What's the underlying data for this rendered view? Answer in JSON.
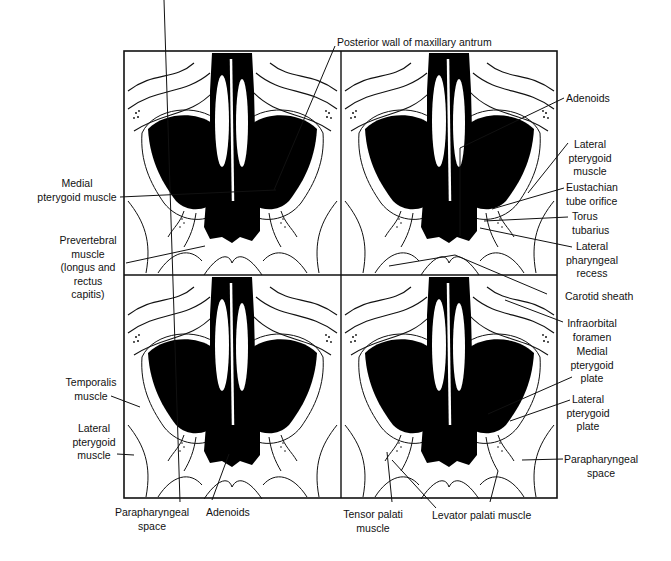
{
  "figure": {
    "type": "anatomical line drawing",
    "panels": [
      {
        "position": "top-left"
      },
      {
        "position": "top-right"
      },
      {
        "position": "bottom-left"
      },
      {
        "position": "bottom-right"
      }
    ]
  },
  "labels": {
    "posterior_wall": "Posterior wall of maxillary antrum",
    "medial_pterygoid_muscle": "Medial\npterygoid muscle",
    "prevertebral_muscle": "Prevertebral\nmuscle\n(longus and\nrectus\ncapitis)",
    "adenoids_tr": "Adenoids",
    "lateral_pterygoid_muscle_tr": "Lateral\npterygoid\nmuscle",
    "eustachian_tube_orifice": "Eustachian\ntube orifice",
    "torus_tubarius": "Torus\ntubarius",
    "lateral_pharyngeal_recess": "Lateral\npharyngeal\nrecess",
    "carotid_sheath": "Carotid sheath",
    "infraorbital_foramen": "Infraorbital\nforamen",
    "medial_pterygoid_plate": "Medial\npterygoid\nplate",
    "lateral_pterygoid_plate": "Lateral\npterygoid\nplate",
    "parapharyngeal_space_br": "Parapharyngeal\nspace",
    "temporalis_muscle": "Temporalis\nmuscle",
    "lateral_pterygoid_muscle_bl": "Lateral\npterygoid\nmuscle",
    "parapharyngeal_space_bl": "Parapharyngeal\nspace",
    "adenoids_bl": "Adenoids",
    "tensor_palati_muscle": "Tensor palati\nmuscle",
    "levator_palati_muscle": "Levator palati muscle"
  },
  "colors": {
    "ink": "#111111",
    "paper": "#ffffff"
  }
}
